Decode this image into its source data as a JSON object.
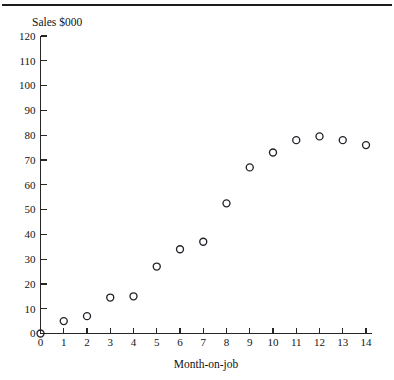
{
  "figure": {
    "has_top_rule": true,
    "background_color": "#ffffff",
    "marker_color": "#23232b",
    "axis_color": "#262626"
  },
  "chart_data": {
    "type": "scatter",
    "title": "",
    "ylabel": "Sales $000",
    "xlabel": "Month-on-job",
    "grid": false,
    "legend": null,
    "xlim": [
      0,
      14
    ],
    "ylim": [
      0,
      120
    ],
    "xticks": [
      "0",
      "1",
      "2",
      "3",
      "4",
      "5",
      "6",
      "7",
      "8",
      "9",
      "10",
      "11",
      "12",
      "13",
      "14"
    ],
    "yticks": [
      "0",
      "10",
      "20",
      "30",
      "40",
      "50",
      "60",
      "70",
      "80",
      "90",
      "100",
      "110",
      "120"
    ],
    "x": [
      0,
      1,
      2,
      3,
      4,
      5,
      6,
      7,
      8,
      9,
      10,
      11,
      12,
      13,
      14
    ],
    "values": [
      0,
      5,
      7,
      14.5,
      15,
      27,
      34,
      37,
      52.5,
      67,
      73,
      78,
      79.5,
      78,
      76
    ],
    "series": [
      {
        "name": "Sales",
        "marker": "open-circle",
        "points": [
          {
            "x": 0,
            "y": 0
          },
          {
            "x": 1,
            "y": 5
          },
          {
            "x": 2,
            "y": 7
          },
          {
            "x": 3,
            "y": 14.5
          },
          {
            "x": 4,
            "y": 15
          },
          {
            "x": 5,
            "y": 27
          },
          {
            "x": 6,
            "y": 34
          },
          {
            "x": 7,
            "y": 37
          },
          {
            "x": 8,
            "y": 52.5
          },
          {
            "x": 9,
            "y": 67
          },
          {
            "x": 10,
            "y": 73
          },
          {
            "x": 11,
            "y": 78
          },
          {
            "x": 12,
            "y": 79.5
          },
          {
            "x": 13,
            "y": 78
          },
          {
            "x": 14,
            "y": 76
          }
        ]
      }
    ]
  }
}
